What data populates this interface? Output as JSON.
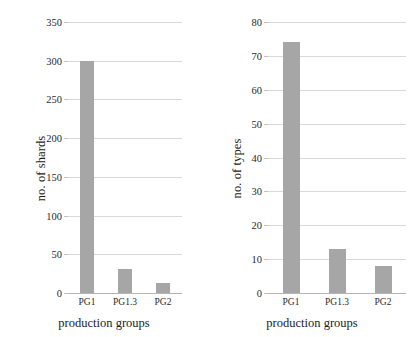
{
  "chart_data": [
    {
      "type": "bar",
      "title": "",
      "categories": [
        "PG1",
        "PG1.3",
        "PG2"
      ],
      "values": [
        300,
        31,
        13
      ],
      "xlabel": "production groups",
      "ylabel": "no. of shards",
      "ylim": [
        0,
        350
      ],
      "yticks": [
        0,
        50,
        100,
        150,
        200,
        250,
        300,
        350
      ],
      "ytick_labels": [
        "0",
        "50",
        "100",
        "150",
        "200",
        "250",
        "300",
        "350"
      ],
      "grid": true,
      "legend": "none",
      "bar_color": "#a6a6a6",
      "grid_color": "#d9d9d9"
    },
    {
      "type": "bar",
      "title": "",
      "categories": [
        "PG1",
        "PG1.3",
        "PG2"
      ],
      "values": [
        74,
        13,
        8
      ],
      "xlabel": "production groups",
      "ylabel": "no. of types",
      "ylim": [
        0,
        80
      ],
      "yticks": [
        0,
        10,
        20,
        30,
        40,
        50,
        60,
        70,
        80
      ],
      "ytick_labels": [
        "0",
        "10",
        "20",
        "30",
        "40",
        "50",
        "60",
        "70",
        "80"
      ],
      "grid": true,
      "legend": "none",
      "bar_color": "#a6a6a6",
      "grid_color": "#d9d9d9"
    }
  ],
  "figure": {
    "background": "#ffffff",
    "panels": [
      {
        "name": "shards-chart"
      },
      {
        "name": "types-chart"
      }
    ]
  }
}
